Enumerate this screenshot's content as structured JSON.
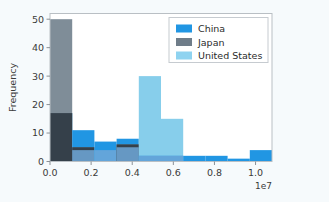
{
  "chart_data": {
    "type": "bar",
    "title": "",
    "subtitle": "",
    "xlabel": "",
    "ylabel": "Frequency",
    "x_offset_text": "1e7",
    "xlim": [
      0.0,
      1.08
    ],
    "ylim": [
      0,
      52
    ],
    "xticks": [
      0.0,
      0.2,
      0.4,
      0.6,
      0.8,
      1.0
    ],
    "xtick_labels": [
      "0.0",
      "0.2",
      "0.4",
      "0.6",
      "0.8",
      "1.0"
    ],
    "yticks": [
      0,
      10,
      20,
      30,
      40,
      50
    ],
    "ytick_labels": [
      "0",
      "10",
      "20",
      "30",
      "40",
      "50"
    ],
    "grid": false,
    "legend_position": "upper right",
    "bin_width": 0.108,
    "bin_edges": [
      0.0,
      0.108,
      0.216,
      0.324,
      0.432,
      0.54,
      0.648,
      0.756,
      0.864,
      0.972,
      1.08
    ],
    "series": [
      {
        "name": "China",
        "color": "#2196e3",
        "values": [
          17,
          11,
          7,
          8,
          2,
          2,
          2,
          2,
          1,
          4
        ]
      },
      {
        "name": "Japan",
        "color": "#74838f",
        "values": [
          50,
          5,
          0,
          6,
          0,
          0,
          0,
          0,
          0,
          0
        ]
      },
      {
        "name": "United States",
        "color": "#87ceeb",
        "values": [
          0,
          4,
          4,
          5,
          30,
          15,
          0,
          0,
          0,
          0
        ]
      }
    ],
    "overlap_color": "#35404a",
    "legend_entries": [
      {
        "label": "China",
        "color": "#2196e3"
      },
      {
        "label": "Japan",
        "color": "#6f7d89"
      },
      {
        "label": "United States",
        "color": "#8fd3f0"
      }
    ]
  },
  "figure": {
    "background_color": "#f6fafc",
    "plot_background_color": "#ffffff",
    "spine_color": "#b9bfc4"
  }
}
